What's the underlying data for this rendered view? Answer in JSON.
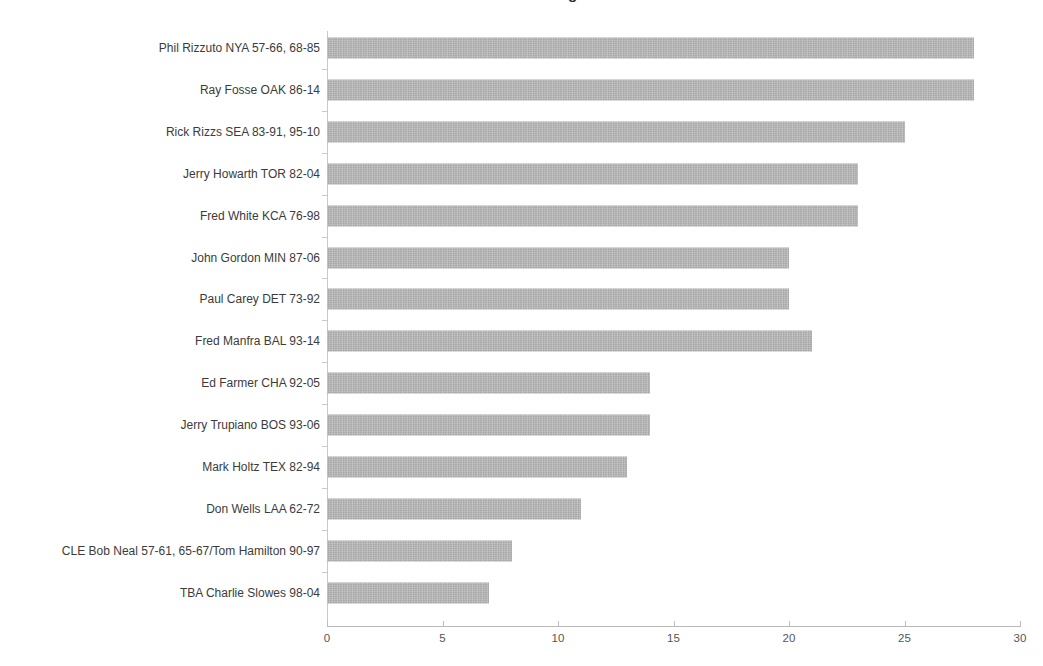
{
  "chart_data": {
    "type": "bar",
    "orientation": "horizontal",
    "title": "MLB Broadcasters — Longest Tenures",
    "title_clipped": true,
    "xlabel": "",
    "ylabel": "",
    "xlim": [
      0,
      30
    ],
    "xticks": [
      0,
      5,
      10,
      15,
      20,
      25,
      30
    ],
    "xtick_labels": [
      "0",
      "5",
      "10",
      "15",
      "20",
      "25",
      "30"
    ],
    "grid": false,
    "legend": "none",
    "bar_color": "#b4b4b4",
    "categories": [
      "Phil Rizzuto NYA 57-66, 68-85",
      "Ray Fosse OAK 86-14",
      "Rick Rizzs SEA 83-91, 95-10",
      "Jerry Howarth TOR 82-04",
      "Fred White KCA 76-98",
      "John Gordon MIN 87-06",
      "Paul Carey DET 73-92",
      "Fred Manfra BAL 93-14",
      "Ed Farmer CHA 92-05",
      "Jerry Trupiano BOS 93-06",
      "Mark Holtz TEX 82-94",
      "Don Wells LAA 62-72",
      "CLE Bob Neal 57-61, 65-67/Tom Hamilton 90-97",
      "TBA Charlie Slowes 98-04"
    ],
    "values": [
      28,
      28,
      25,
      23,
      23,
      20,
      20,
      21,
      14,
      14,
      13,
      11,
      8,
      7
    ]
  }
}
